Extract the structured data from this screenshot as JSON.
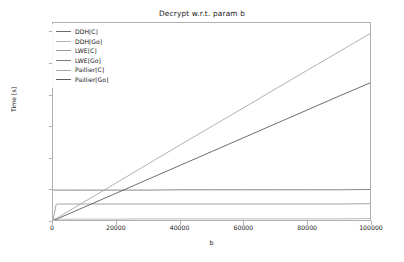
{
  "chart_data": {
    "type": "line",
    "title": "Decrypt w.r.t. param b",
    "xlabel": "b",
    "ylabel": "Time [s]",
    "xlim": [
      0,
      100000
    ],
    "ylim": [
      0.0,
      0.63
    ],
    "xticks": [
      0,
      20000,
      40000,
      60000,
      80000,
      100000
    ],
    "xtick_labels": [
      "0",
      "20000",
      "40000",
      "60000",
      "80000",
      "100000"
    ],
    "yticks": [
      0.0,
      0.1,
      0.2,
      0.3,
      0.4,
      0.5,
      0.6
    ],
    "ytick_labels": [
      "0.0",
      "0.1",
      "0.2",
      "0.3",
      "0.4",
      "0.5",
      "0.6"
    ],
    "grid": false,
    "legend_position": "upper left",
    "x": [
      0,
      500,
      1000,
      2000,
      5000,
      10000,
      20000,
      30000,
      40000,
      50000,
      60000,
      70000,
      80000,
      90000,
      100000
    ],
    "series": [
      {
        "name": "DDH[C]",
        "color": "#6d6d6d",
        "values": [
          0.003,
          0.003,
          0.003,
          0.003,
          0.003,
          0.003,
          0.003,
          0.003,
          0.003,
          0.003,
          0.003,
          0.003,
          0.003,
          0.003,
          0.004
        ]
      },
      {
        "name": "DDH[Go]",
        "color": "#b4b4b4",
        "values": [
          0.009,
          0.009,
          0.009,
          0.009,
          0.009,
          0.009,
          0.009,
          0.01,
          0.01,
          0.01,
          0.01,
          0.01,
          0.01,
          0.01,
          0.011
        ]
      },
      {
        "name": "LWE[C]",
        "color": "#9a9a9a",
        "values": [
          0.006,
          0.03,
          0.056,
          0.057,
          0.057,
          0.057,
          0.057,
          0.057,
          0.057,
          0.057,
          0.057,
          0.057,
          0.057,
          0.057,
          0.058
        ]
      },
      {
        "name": "LWE[Go]",
        "color": "#7a7a7a",
        "values": [
          0.101,
          0.101,
          0.101,
          0.101,
          0.101,
          0.101,
          0.101,
          0.101,
          0.102,
          0.102,
          0.102,
          0.102,
          0.102,
          0.102,
          0.103
        ]
      },
      {
        "name": "Paillier[C]",
        "color": "#a8a8a8",
        "values": [
          0.005,
          0.008,
          0.011,
          0.017,
          0.035,
          0.065,
          0.125,
          0.185,
          0.245,
          0.304,
          0.363,
          0.423,
          0.482,
          0.541,
          0.6
        ]
      },
      {
        "name": "Paillier[Go]",
        "color": "#5e5e5e",
        "values": [
          0.004,
          0.006,
          0.008,
          0.013,
          0.026,
          0.048,
          0.092,
          0.136,
          0.18,
          0.224,
          0.268,
          0.312,
          0.356,
          0.4,
          0.443
        ]
      }
    ]
  }
}
